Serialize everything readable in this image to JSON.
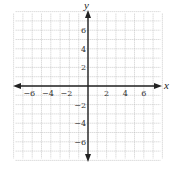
{
  "chart_data": {
    "type": "scatter",
    "title": "",
    "xlabel": "x",
    "ylabel": "y",
    "xlim": [
      -8,
      8
    ],
    "ylim": [
      -8,
      8
    ],
    "grid": true,
    "grid_step": 1,
    "x_ticks": [
      -6,
      -4,
      -2,
      2,
      4,
      6
    ],
    "y_ticks": [
      6,
      4,
      2,
      -2,
      -4,
      -6
    ],
    "x_tick_labels": [
      "−6",
      "−4",
      "−2",
      "2",
      "4",
      "6"
    ],
    "y_tick_labels": [
      "6",
      "4",
      "2",
      "−2",
      "−4",
      "−6"
    ],
    "series": [],
    "legend": null,
    "arrows_on_axes": true
  },
  "colors": {
    "grid": "#b8b8b8",
    "axis": "#222222",
    "text": "#333333"
  }
}
